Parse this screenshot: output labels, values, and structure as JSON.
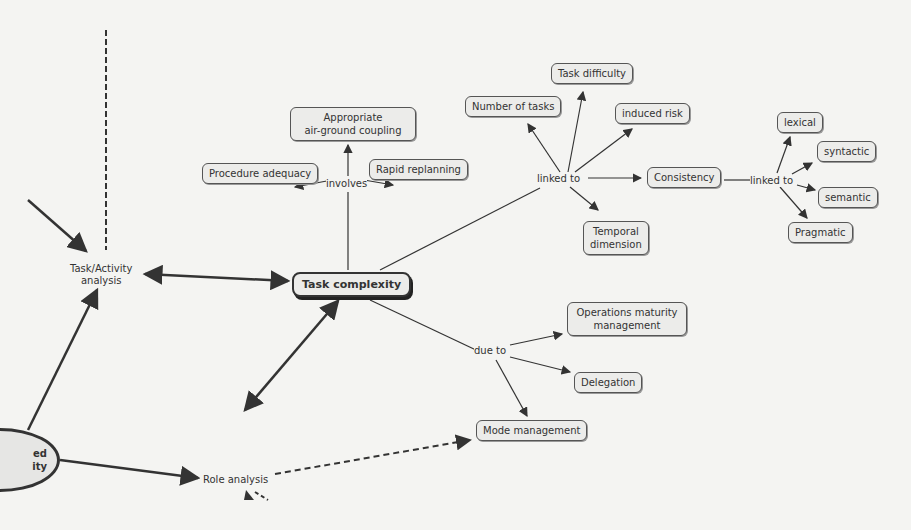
{
  "diagram": {
    "type": "concept-map",
    "central_node": "Task complexity",
    "nodes": {
      "task_complexity": "Task complexity",
      "appropriate_coupling_l1": "Appropriate",
      "appropriate_coupling_l2": "air-ground coupling",
      "procedure_adequacy": "Procedure adequacy",
      "rapid_replanning": "Rapid replanning",
      "number_of_tasks": "Number of tasks",
      "task_difficulty": "Task difficulty",
      "induced_risk": "induced risk",
      "consistency": "Consistency",
      "temporal_l1": "Temporal",
      "temporal_l2": "dimension",
      "lexical": "lexical",
      "syntactic": "syntactic",
      "semantic": "semantic",
      "pragmatic": "Pragmatic",
      "ops_maturity_l1": "Operations maturity",
      "ops_maturity_l2": "management",
      "delegation": "Delegation",
      "mode_management": "Mode management",
      "task_activity_l1": "Task/Activity",
      "task_activity_l2": "analysis",
      "role_analysis": "Role analysis",
      "partial_ellipse_l1": "ed",
      "partial_ellipse_l2": "ity"
    },
    "link_labels": {
      "involves": "involves",
      "linked_to_1": "linked to",
      "linked_to_2": "linked to",
      "due_to": "due to"
    },
    "colors": {
      "background": "#f4f4f2",
      "node_fill": "#ececea",
      "stroke": "#333333"
    }
  }
}
